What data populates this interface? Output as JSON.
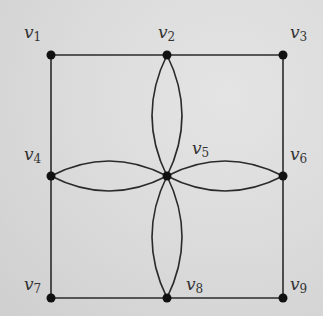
{
  "diagram": {
    "type": "graph",
    "vertices": [
      {
        "id": "v1",
        "name": "v",
        "sub": "1",
        "x": 51,
        "y": 55,
        "lx": 24,
        "ly": 24
      },
      {
        "id": "v2",
        "name": "v",
        "sub": "2",
        "x": 167,
        "y": 55,
        "lx": 158,
        "ly": 24
      },
      {
        "id": "v3",
        "name": "v",
        "sub": "3",
        "x": 283,
        "y": 55,
        "lx": 290,
        "ly": 24
      },
      {
        "id": "v4",
        "name": "v",
        "sub": "4",
        "x": 51,
        "y": 176,
        "lx": 24,
        "ly": 146
      },
      {
        "id": "v5",
        "name": "v",
        "sub": "5",
        "x": 167,
        "y": 176,
        "lx": 192,
        "ly": 140
      },
      {
        "id": "v6",
        "name": "v",
        "sub": "6",
        "x": 283,
        "y": 176,
        "lx": 290,
        "ly": 146
      },
      {
        "id": "v7",
        "name": "v",
        "sub": "7",
        "x": 51,
        "y": 298,
        "lx": 24,
        "ly": 276
      },
      {
        "id": "v8",
        "name": "v",
        "sub": "8",
        "x": 167,
        "y": 298,
        "lx": 186,
        "ly": 276
      },
      {
        "id": "v9",
        "name": "v",
        "sub": "9",
        "x": 283,
        "y": 298,
        "lx": 290,
        "ly": 276
      }
    ],
    "edges": [
      {
        "from": "v1",
        "to": "v2",
        "kind": "straight"
      },
      {
        "from": "v2",
        "to": "v3",
        "kind": "straight"
      },
      {
        "from": "v1",
        "to": "v4",
        "kind": "straight"
      },
      {
        "from": "v4",
        "to": "v7",
        "kind": "straight"
      },
      {
        "from": "v3",
        "to": "v6",
        "kind": "straight"
      },
      {
        "from": "v6",
        "to": "v9",
        "kind": "straight"
      },
      {
        "from": "v7",
        "to": "v8",
        "kind": "straight"
      },
      {
        "from": "v8",
        "to": "v9",
        "kind": "straight"
      },
      {
        "from": "v2",
        "to": "v5",
        "kind": "curve",
        "bulge": -30
      },
      {
        "from": "v2",
        "to": "v5",
        "kind": "curve",
        "bulge": 30
      },
      {
        "from": "v4",
        "to": "v5",
        "kind": "curve",
        "bulge": -30
      },
      {
        "from": "v4",
        "to": "v5",
        "kind": "curve",
        "bulge": 30
      },
      {
        "from": "v5",
        "to": "v6",
        "kind": "curve",
        "bulge": -30
      },
      {
        "from": "v5",
        "to": "v6",
        "kind": "curve",
        "bulge": 30
      },
      {
        "from": "v5",
        "to": "v8",
        "kind": "curve",
        "bulge": -30
      },
      {
        "from": "v5",
        "to": "v8",
        "kind": "curve",
        "bulge": 30
      }
    ],
    "colors": {
      "edge": "#2a2a2a",
      "vertex": "#111111",
      "label": "#333333"
    }
  }
}
